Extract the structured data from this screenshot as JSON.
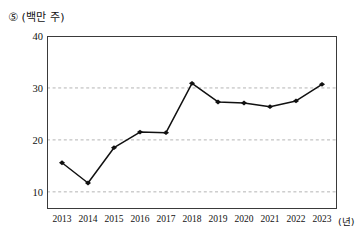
{
  "caption": {
    "marker": "⑤",
    "unit": "(백만 주)"
  },
  "axis": {
    "x_unit_label": "(년)"
  },
  "chart_data": {
    "type": "line",
    "title": "",
    "subtitle": "",
    "xlabel": "(년)",
    "ylabel": "(백만 주)",
    "categories": [
      "2013",
      "2014",
      "2015",
      "2016",
      "2017",
      "2018",
      "2019",
      "2020",
      "2021",
      "2022",
      "2023"
    ],
    "values": [
      15.6,
      11.7,
      18.5,
      21.5,
      21.4,
      30.9,
      27.3,
      27.1,
      26.4,
      27.5,
      30.7
    ],
    "series": [
      {
        "name": "",
        "values": [
          15.6,
          11.7,
          18.5,
          21.5,
          21.4,
          30.9,
          27.3,
          27.1,
          26.4,
          27.5,
          30.7
        ]
      }
    ],
    "ylim": [
      6.7,
      40
    ],
    "yticks": [
      10,
      20,
      30,
      40
    ],
    "ytick_labels": [
      "10",
      "20",
      "30",
      "40"
    ],
    "gridlines": [
      10,
      20,
      30
    ],
    "grid": true,
    "grid_style": "dashed",
    "legend": "none",
    "marker_style": "diamond",
    "line_color": "#111111",
    "marker_color": "#111111",
    "grid_color": "#b4b4b4",
    "axis_color": "#3a3a3a",
    "background": "#ffffff"
  }
}
